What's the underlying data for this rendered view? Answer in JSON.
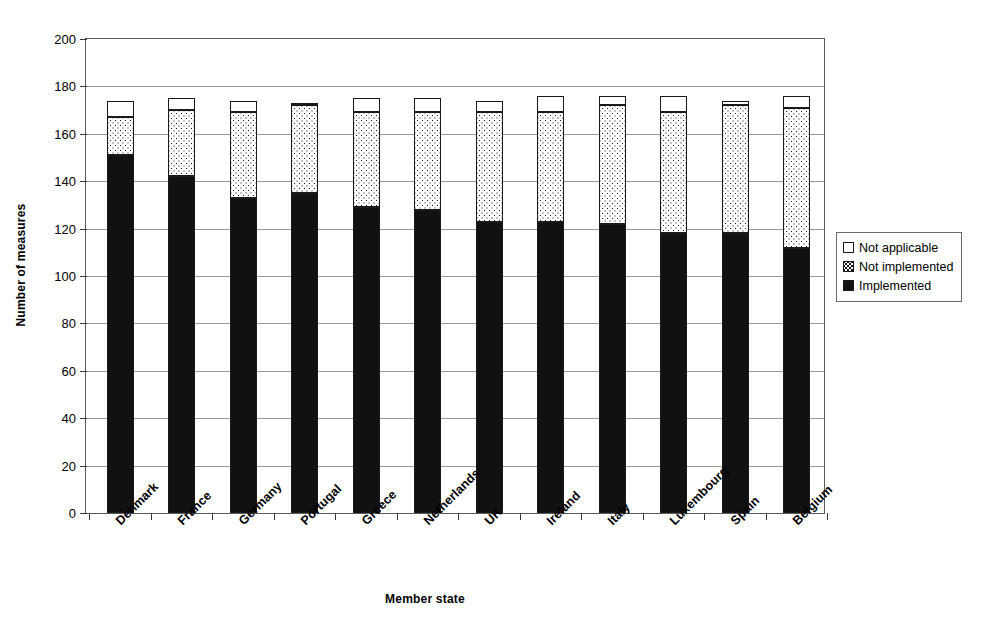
{
  "chart_data": {
    "type": "bar",
    "subtype": "stacked-vertical",
    "title": "",
    "xlabel": "Member state",
    "ylabel": "Number of measures",
    "ylim": [
      0,
      200
    ],
    "ytick_step": 20,
    "yticks": [
      0,
      20,
      40,
      60,
      80,
      100,
      120,
      140,
      160,
      180,
      200
    ],
    "grid": "horizontal",
    "legend_position": "right",
    "categories": [
      "Denmark",
      "France",
      "Germany",
      "Portugal",
      "Greece",
      "Netherlands",
      "UK",
      "Ireland",
      "Italy",
      "Luxembourg",
      "Spain",
      "Belgium"
    ],
    "series": [
      {
        "name": "Implemented",
        "fill": "solid-black",
        "color": "#111111",
        "values": [
          151,
          142,
          133,
          135,
          129,
          128,
          123,
          123,
          122,
          118,
          118,
          112
        ]
      },
      {
        "name": "Not implemented",
        "fill": "dotted",
        "color": "#ffffff",
        "values": [
          16,
          28,
          36,
          37,
          40,
          41,
          46,
          46,
          50,
          51,
          54,
          59
        ]
      },
      {
        "name": "Not applicable",
        "fill": "white",
        "color": "#ffffff",
        "values": [
          7,
          5,
          5,
          1,
          6,
          6,
          5,
          7,
          4,
          7,
          2,
          5
        ]
      }
    ],
    "totals": [
      174,
      175,
      174,
      173,
      175,
      175,
      174,
      176,
      176,
      176,
      174,
      176
    ],
    "cumulative_implemented_plus_notimplemented": [
      167,
      170,
      169,
      172,
      169,
      169,
      169,
      169,
      172,
      169,
      172,
      171
    ]
  },
  "legend": {
    "items": [
      {
        "label": "Not applicable",
        "swatch": "white-square-icon"
      },
      {
        "label": "Not implemented",
        "swatch": "dotted-square-icon"
      },
      {
        "label": "Implemented",
        "swatch": "black-square-icon"
      }
    ]
  }
}
